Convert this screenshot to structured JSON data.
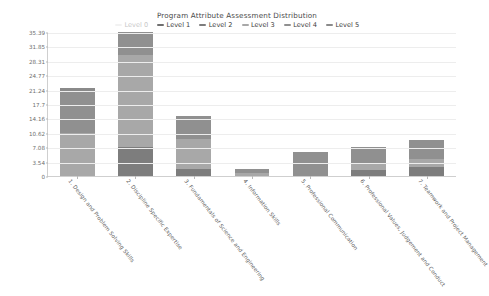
{
  "chart_data": {
    "type": "bar",
    "stacked": true,
    "title": "Program Attribute Assessment Distribution",
    "xlabel": "",
    "ylabel": "",
    "ylim": [
      0,
      35.39
    ],
    "grid": true,
    "legend_position": "top",
    "ytick_labels": [
      "35.39",
      "31.85",
      "28.31",
      "24.77",
      "21.24",
      "17.7",
      "14.16",
      "10.62",
      "7.08",
      "3.54",
      "0"
    ],
    "ytick_values": [
      35.39,
      31.85,
      28.31,
      24.77,
      21.24,
      17.7,
      14.16,
      10.62,
      7.08,
      3.54,
      0
    ],
    "categories": [
      "1. Design and Problem Solving Skills",
      "2. Discipline Specific Expertise",
      "3. Fundamentals of Science and Engineering",
      "4. Information Skills",
      "5. Professional Communication",
      "6. Professional Values, Judgement and Conduct",
      "7. Teamwork and Project Management"
    ],
    "series": [
      {
        "name": "Level 0",
        "color": "#d9d9d9",
        "disabled": true,
        "values": [
          0,
          0,
          0,
          0,
          0,
          0,
          0
        ]
      },
      {
        "name": "Level 1",
        "color": "#6f6f6f",
        "disabled": false,
        "values": [
          0,
          0,
          0,
          0,
          0,
          0,
          0
        ]
      },
      {
        "name": "Level 2",
        "color": "#7d7d7d",
        "disabled": false,
        "values": [
          0,
          7.08,
          1.77,
          0,
          0,
          1.42,
          2.12
        ]
      },
      {
        "name": "Level 3",
        "color": "#a8a8a8",
        "disabled": false,
        "values": [
          10.62,
          22.65,
          7.43,
          0.71,
          0,
          1.42,
          2.12
        ]
      },
      {
        "name": "Level 4",
        "color": "#909090",
        "disabled": false,
        "values": [
          9.91,
          5.66,
          5.66,
          1.06,
          6.02,
          4.25,
          4.6
        ]
      },
      {
        "name": "Level 5",
        "color": "#8a8a8a",
        "disabled": false,
        "values": [
          1.06,
          0,
          0,
          0,
          0,
          0,
          0
        ]
      }
    ],
    "totals": [
      21.59,
      35.39,
      14.86,
      1.77,
      6.02,
      7.09,
      8.84
    ]
  },
  "colors": {
    "axis": "#cfcfcf",
    "grid": "#ededed",
    "tick_text": "#6e6e6e",
    "title_text": "#4a4a4a",
    "legend_text": "#3d3d3d",
    "legend_disabled_text": "#c8c8c8",
    "background": "#ffffff"
  }
}
